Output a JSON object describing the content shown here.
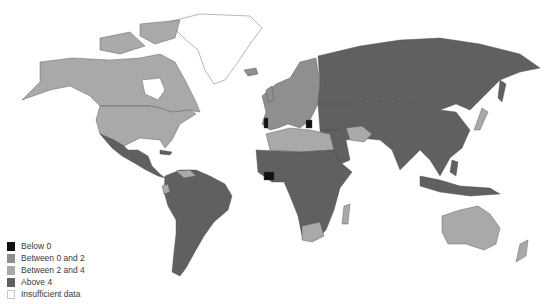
{
  "legend": {
    "items": [
      {
        "label": "Below 0",
        "color": "#111111"
      },
      {
        "label": "Between 0 and 2",
        "color": "#8f8f8f"
      },
      {
        "label": "Between 2 and 4",
        "color": "#a9a9a9"
      },
      {
        "label": "Above 4",
        "color": "#606060"
      },
      {
        "label": "Insufficient data",
        "color": "#ffffff"
      }
    ]
  },
  "colors": {
    "below_0": "#111111",
    "between_0_2": "#8f8f8f",
    "between_2_4": "#a9a9a9",
    "above_4": "#606060",
    "insufficient": "#ffffff",
    "background": "#ffffff"
  },
  "regions": [
    {
      "name": "North America (USA, Canada, Alaska)",
      "category": "Between 2 and 4"
    },
    {
      "name": "Greenland",
      "category": "Insufficient data"
    },
    {
      "name": "Mexico",
      "category": "Above 4"
    },
    {
      "name": "Central America",
      "category": "Above 4"
    },
    {
      "name": "Venezuela",
      "category": "Between 2 and 4"
    },
    {
      "name": "Ecuador",
      "category": "Between 2 and 4"
    },
    {
      "name": "South America",
      "category": "Above 4"
    },
    {
      "name": "Western Europe",
      "category": "Between 0 and 2"
    },
    {
      "name": "Portugal",
      "category": "Below 0"
    },
    {
      "name": "Greece",
      "category": "Below 0"
    },
    {
      "name": "Russia",
      "category": "Above 4"
    },
    {
      "name": "China / Central Asia",
      "category": "Above 4"
    },
    {
      "name": "India / South Asia",
      "category": "Above 4"
    },
    {
      "name": "Iran",
      "category": "Between 2 and 4"
    },
    {
      "name": "Japan",
      "category": "Between 2 and 4"
    },
    {
      "name": "Southeast Asia",
      "category": "Above 4"
    },
    {
      "name": "Algeria / Libya / Egypt",
      "category": "Between 2 and 4"
    },
    {
      "name": "Sub-Saharan Africa",
      "category": "Above 4"
    },
    {
      "name": "Côte d'Ivoire",
      "category": "Below 0"
    },
    {
      "name": "South Africa",
      "category": "Between 2 and 4"
    },
    {
      "name": "Madagascar",
      "category": "Between 2 and 4"
    },
    {
      "name": "Australia",
      "category": "Between 2 and 4"
    },
    {
      "name": "New Zealand",
      "category": "Between 2 and 4"
    }
  ]
}
